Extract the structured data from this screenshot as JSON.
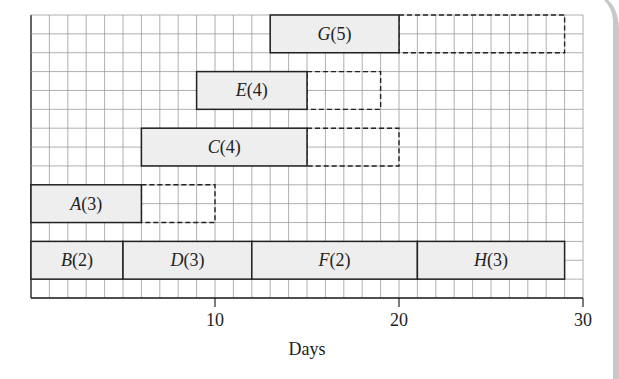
{
  "chart_data": {
    "type": "gantt",
    "title": "",
    "xlabel": "Days",
    "ylabel": "",
    "xlim": [
      0,
      30
    ],
    "xticks": [
      10,
      20,
      30
    ],
    "grid": true,
    "tasks": [
      {
        "label": "A",
        "duration_label": "3",
        "text": "A(3)",
        "row": 3,
        "start": 0,
        "end": 6,
        "float_end": 10
      },
      {
        "label": "B",
        "duration_label": "2",
        "text": "B(2)",
        "row": 4,
        "start": 0,
        "end": 5,
        "float_end": null
      },
      {
        "label": "C",
        "duration_label": "4",
        "text": "C(4)",
        "row": 2,
        "start": 6,
        "end": 15,
        "float_end": 20
      },
      {
        "label": "D",
        "duration_label": "3",
        "text": "D(3)",
        "row": 4,
        "start": 5,
        "end": 12,
        "float_end": null
      },
      {
        "label": "E",
        "duration_label": "4",
        "text": "E(4)",
        "row": 1,
        "start": 9,
        "end": 15,
        "float_end": 19
      },
      {
        "label": "F",
        "duration_label": "2",
        "text": "F(2)",
        "row": 4,
        "start": 12,
        "end": 21,
        "float_end": null
      },
      {
        "label": "G",
        "duration_label": "5",
        "text": "G(5)",
        "row": 0,
        "start": 13,
        "end": 20,
        "float_end": 29
      },
      {
        "label": "H",
        "duration_label": "3",
        "text": "H(3)",
        "row": 4,
        "start": 21,
        "end": 29,
        "float_end": null
      }
    ],
    "legend": null,
    "annotations": [
      "Solid bars = activity duration",
      "Dashed boxes = float"
    ]
  },
  "axis": {
    "x_label": "Days",
    "tick_10": "10",
    "tick_20": "20",
    "tick_30": "30"
  },
  "colors": {
    "bar_fill": "#eeeeee",
    "bar_stroke": "#222222",
    "grid": "#9a9a9a",
    "axis": "#222222",
    "float_stroke": "#222222"
  }
}
